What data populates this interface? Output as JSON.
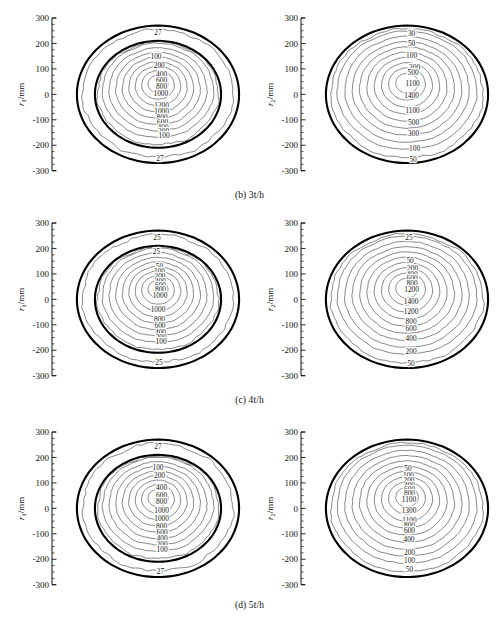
{
  "figure": {
    "type": "contour-panel-grid",
    "rows": 3,
    "cols": 2
  },
  "axes": {
    "y_ticks": [
      "300",
      "200",
      "100",
      "0",
      "-100",
      "-200",
      "-300"
    ],
    "y_tick_values": [
      300,
      200,
      100,
      0,
      -100,
      -200,
      -300
    ],
    "ylim": [
      -300,
      300
    ],
    "ylabel_left_var": "r",
    "ylabel_left_sub": "1",
    "ylabel_left_unit": "/mm",
    "ylabel_right_var": "r",
    "ylabel_right_sub": "2",
    "ylabel_right_unit": "/mm"
  },
  "captions": {
    "b": "(b) 3t/h",
    "c": "(c) 4t/h",
    "d": "(d) 5t/h"
  },
  "chart_data": [
    {
      "type": "contour",
      "panel": "b-left",
      "caption": "(b) 3t/h",
      "ylabel": "r1/mm",
      "xlabel": "",
      "ylim": [
        -300,
        300
      ],
      "grid": false,
      "legend": "none",
      "outer_rings": [
        270,
        210
      ],
      "peak_value": 1200,
      "labels_top_to_bottom": [
        "27",
        "100",
        "200",
        "400",
        "600",
        "800",
        "1000",
        "1200",
        "1000",
        "800",
        "600",
        "400",
        "200",
        "100",
        "27"
      ],
      "levels": [
        27,
        100,
        200,
        400,
        600,
        800,
        1000,
        1200
      ],
      "outer_label": "27"
    },
    {
      "type": "contour",
      "panel": "b-right",
      "caption": "(b) 3t/h",
      "ylabel": "r2/mm",
      "xlabel": "",
      "ylim": [
        -300,
        300
      ],
      "grid": false,
      "legend": "none",
      "outer_rings": [
        270
      ],
      "peak_value": 1400,
      "labels_top_to_bottom": [
        "30",
        "50",
        "100",
        "300",
        "500",
        "1100",
        "1400",
        "1100",
        "500",
        "300",
        "100",
        "50"
      ],
      "levels": [
        30,
        50,
        100,
        300,
        500,
        1100,
        1400
      ],
      "outer_label": "30"
    },
    {
      "type": "contour",
      "panel": "c-left",
      "caption": "(c) 4t/h",
      "ylabel": "r1/mm",
      "xlabel": "",
      "ylim": [
        -300,
        300
      ],
      "grid": false,
      "legend": "none",
      "outer_rings": [
        270,
        210
      ],
      "peak_value": 1000,
      "labels_top_to_bottom": [
        "25",
        "25",
        "50",
        "100",
        "200",
        "400",
        "600",
        "800",
        "1000",
        "1000",
        "800",
        "600",
        "400",
        "200",
        "100",
        "25"
      ],
      "levels": [
        25,
        50,
        100,
        200,
        400,
        600,
        800,
        1000
      ],
      "outer_label": "25"
    },
    {
      "type": "contour",
      "panel": "c-right",
      "caption": "(c) 4t/h",
      "ylabel": "r2/mm",
      "xlabel": "",
      "ylim": [
        -300,
        300
      ],
      "grid": false,
      "legend": "none",
      "outer_rings": [
        270
      ],
      "peak_value": 1400,
      "labels_top_to_bottom": [
        "25",
        "50",
        "200",
        "400",
        "600",
        "800",
        "1200",
        "1400",
        "1200",
        "800",
        "600",
        "400",
        "200",
        "50"
      ],
      "levels": [
        25,
        50,
        200,
        400,
        600,
        800,
        1200,
        1400
      ],
      "outer_label": "25"
    },
    {
      "type": "contour",
      "panel": "d-left",
      "caption": "(d) 5t/h",
      "ylabel": "r1/mm",
      "xlabel": "",
      "ylim": [
        -300,
        300
      ],
      "grid": false,
      "legend": "none",
      "outer_rings": [
        270,
        210
      ],
      "peak_value": 1000,
      "labels_top_to_bottom": [
        "27",
        "100",
        "200",
        "400",
        "600",
        "800",
        "1000",
        "1000",
        "800",
        "600",
        "400",
        "200",
        "100",
        "27"
      ],
      "levels": [
        27,
        100,
        200,
        400,
        600,
        800,
        1000
      ],
      "outer_label": "27"
    },
    {
      "type": "contour",
      "panel": "d-right",
      "caption": "(d) 5t/h",
      "ylabel": "r2/mm",
      "xlabel": "",
      "ylim": [
        -300,
        300
      ],
      "grid": false,
      "legend": "none",
      "outer_rings": [
        270
      ],
      "peak_value": 1300,
      "labels_top_to_bottom": [
        "50",
        "100",
        "200",
        "400",
        "600",
        "800",
        "1100",
        "1300",
        "1100",
        "800",
        "600",
        "400",
        "200",
        "100",
        "50"
      ],
      "levels": [
        50,
        100,
        200,
        400,
        600,
        800,
        1100,
        1300
      ],
      "outer_label": "50"
    }
  ],
  "panels": {
    "b_left": {
      "labels": [
        {
          "t": "27",
          "x": 0,
          "y": 243
        },
        {
          "t": "100",
          "x": -8,
          "y": 148
        },
        {
          "t": "200",
          "x": 5,
          "y": 112
        },
        {
          "t": "400",
          "x": 14,
          "y": 78
        },
        {
          "t": "600",
          "x": 14,
          "y": 55
        },
        {
          "t": "800",
          "x": 14,
          "y": 33
        },
        {
          "t": "1000",
          "x": 11,
          "y": 4
        },
        {
          "t": "1200",
          "x": 14,
          "y": -42
        },
        {
          "t": "1000",
          "x": 14,
          "y": -68
        },
        {
          "t": "800",
          "x": 16,
          "y": -90
        },
        {
          "t": "600",
          "x": 18,
          "y": -110
        },
        {
          "t": "400",
          "x": 20,
          "y": -128
        },
        {
          "t": "200",
          "x": 22,
          "y": -145
        },
        {
          "t": "100",
          "x": 24,
          "y": -163
        },
        {
          "t": "27",
          "x": 8,
          "y": -250
        }
      ]
    },
    "b_right": {
      "labels": [
        {
          "t": "30",
          "x": 18,
          "y": 240
        },
        {
          "t": "50",
          "x": 18,
          "y": 200
        },
        {
          "t": "100",
          "x": 18,
          "y": 155
        },
        {
          "t": "300",
          "x": 30,
          "y": 105
        },
        {
          "t": "500",
          "x": 24,
          "y": 85
        },
        {
          "t": "1100",
          "x": 22,
          "y": 45
        },
        {
          "t": "1400",
          "x": 18,
          "y": -5
        },
        {
          "t": "1100",
          "x": 22,
          "y": -62
        },
        {
          "t": "500",
          "x": 26,
          "y": -110
        },
        {
          "t": "300",
          "x": 26,
          "y": -155
        },
        {
          "t": "100",
          "x": 30,
          "y": -212
        },
        {
          "t": "50",
          "x": 24,
          "y": -255
        }
      ]
    },
    "c_left": {
      "labels": [
        {
          "t": "25",
          "x": -4,
          "y": 243
        },
        {
          "t": "25",
          "x": -6,
          "y": 190
        },
        {
          "t": "50",
          "x": 6,
          "y": 128
        },
        {
          "t": "100",
          "x": 6,
          "y": 110
        },
        {
          "t": "200",
          "x": 8,
          "y": 90
        },
        {
          "t": "400",
          "x": 10,
          "y": 72
        },
        {
          "t": "600",
          "x": 10,
          "y": 55
        },
        {
          "t": "800",
          "x": 10,
          "y": 38
        },
        {
          "t": "1000",
          "x": 8,
          "y": 16
        },
        {
          "t": "1000",
          "x": 0,
          "y": -40
        },
        {
          "t": "800",
          "x": 6,
          "y": -78
        },
        {
          "t": "600",
          "x": 8,
          "y": -102
        },
        {
          "t": "400",
          "x": 10,
          "y": -128
        },
        {
          "t": "200",
          "x": 12,
          "y": -148
        },
        {
          "t": "100",
          "x": 12,
          "y": -165
        },
        {
          "t": "25",
          "x": 4,
          "y": -248
        }
      ]
    },
    "c_right": {
      "labels": [
        {
          "t": "25",
          "x": 8,
          "y": 245
        },
        {
          "t": "50",
          "x": 12,
          "y": 155
        },
        {
          "t": "200",
          "x": 22,
          "y": 120
        },
        {
          "t": "400",
          "x": 20,
          "y": 100
        },
        {
          "t": "600",
          "x": 20,
          "y": 82
        },
        {
          "t": "800",
          "x": 20,
          "y": 64
        },
        {
          "t": "1200",
          "x": 18,
          "y": 38
        },
        {
          "t": "1400",
          "x": 16,
          "y": -8
        },
        {
          "t": "1200",
          "x": 16,
          "y": -48
        },
        {
          "t": "800",
          "x": 16,
          "y": -86
        },
        {
          "t": "600",
          "x": 16,
          "y": -115
        },
        {
          "t": "400",
          "x": 16,
          "y": -155
        },
        {
          "t": "200",
          "x": 16,
          "y": -205
        },
        {
          "t": "50",
          "x": 16,
          "y": -252
        }
      ]
    },
    "d_left": {
      "labels": [
        {
          "t": "27",
          "x": 0,
          "y": 243
        },
        {
          "t": "100",
          "x": 0,
          "y": 160
        },
        {
          "t": "200",
          "x": 6,
          "y": 128
        },
        {
          "t": "400",
          "x": 14,
          "y": 82
        },
        {
          "t": "600",
          "x": 14,
          "y": 52
        },
        {
          "t": "800",
          "x": 14,
          "y": 26
        },
        {
          "t": "1000",
          "x": 14,
          "y": -6
        },
        {
          "t": "1000",
          "x": 14,
          "y": -38
        },
        {
          "t": "800",
          "x": 14,
          "y": -72
        },
        {
          "t": "600",
          "x": 16,
          "y": -95
        },
        {
          "t": "400",
          "x": 16,
          "y": -118
        },
        {
          "t": "200",
          "x": 16,
          "y": -140
        },
        {
          "t": "100",
          "x": 16,
          "y": -160
        },
        {
          "t": "27",
          "x": 10,
          "y": -248
        }
      ]
    },
    "d_right": {
      "labels": [
        {
          "t": "50",
          "x": 4,
          "y": 158
        },
        {
          "t": "100",
          "x": 6,
          "y": 130
        },
        {
          "t": "200",
          "x": 8,
          "y": 110
        },
        {
          "t": "400",
          "x": 10,
          "y": 92
        },
        {
          "t": "600",
          "x": 10,
          "y": 74
        },
        {
          "t": "800",
          "x": 10,
          "y": 58
        },
        {
          "t": "1100",
          "x": 8,
          "y": 34
        },
        {
          "t": "1300",
          "x": 8,
          "y": -8
        },
        {
          "t": "1100",
          "x": 10,
          "y": -48
        },
        {
          "t": "800",
          "x": 10,
          "y": -68
        },
        {
          "t": "600",
          "x": 10,
          "y": -88
        },
        {
          "t": "400",
          "x": 8,
          "y": -120
        },
        {
          "t": "200",
          "x": 10,
          "y": -172
        },
        {
          "t": "100",
          "x": 10,
          "y": -205
        },
        {
          "t": "50",
          "x": 10,
          "y": -240
        }
      ]
    }
  }
}
